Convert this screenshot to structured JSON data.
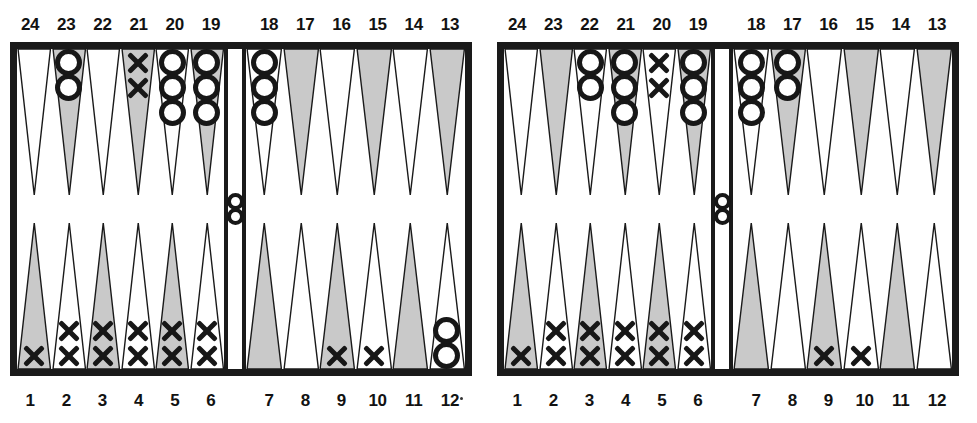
{
  "figure": {
    "kind": "backgammon-position-pair",
    "colors": {
      "ink": "#1a1a1a",
      "point_shaded": "#c9c9c9",
      "point_light": "#ffffff",
      "background": "#ffffff"
    },
    "checker_glyphs": {
      "o": "O",
      "x": "X"
    }
  },
  "boards": [
    {
      "id": "left",
      "top_labels": [
        "24",
        "23",
        "22",
        "21",
        "20",
        "19",
        "18",
        "17",
        "16",
        "15",
        "14",
        "13"
      ],
      "bottom_labels": [
        "1",
        "2",
        "3",
        "4",
        "5",
        "6",
        "7",
        "8",
        "9",
        "10",
        "11",
        "12"
      ],
      "bar": {
        "count": 2,
        "type": "o"
      },
      "points": {
        "24": {
          "count": 0,
          "type": null,
          "shade": "light"
        },
        "23": {
          "count": 2,
          "type": "o",
          "shade": "shaded"
        },
        "22": {
          "count": 0,
          "type": null,
          "shade": "light"
        },
        "21": {
          "count": 2,
          "type": "x",
          "shade": "shaded"
        },
        "20": {
          "count": 3,
          "type": "o",
          "shade": "light"
        },
        "19": {
          "count": 3,
          "type": "o",
          "shade": "shaded"
        },
        "18": {
          "count": 3,
          "type": "o",
          "shade": "light"
        },
        "17": {
          "count": 0,
          "type": null,
          "shade": "shaded"
        },
        "16": {
          "count": 0,
          "type": null,
          "shade": "light"
        },
        "15": {
          "count": 0,
          "type": null,
          "shade": "shaded"
        },
        "14": {
          "count": 0,
          "type": null,
          "shade": "light"
        },
        "13": {
          "count": 0,
          "type": null,
          "shade": "shaded"
        },
        "1": {
          "count": 1,
          "type": "x",
          "shade": "shaded"
        },
        "2": {
          "count": 2,
          "type": "x",
          "shade": "light"
        },
        "3": {
          "count": 2,
          "type": "x",
          "shade": "shaded"
        },
        "4": {
          "count": 2,
          "type": "x",
          "shade": "light"
        },
        "5": {
          "count": 2,
          "type": "x",
          "shade": "shaded"
        },
        "6": {
          "count": 2,
          "type": "x",
          "shade": "light"
        },
        "7": {
          "count": 0,
          "type": null,
          "shade": "shaded"
        },
        "8": {
          "count": 0,
          "type": null,
          "shade": "light"
        },
        "9": {
          "count": 1,
          "type": "x",
          "shade": "shaded"
        },
        "10": {
          "count": 1,
          "type": "x",
          "shade": "light"
        },
        "11": {
          "count": 0,
          "type": null,
          "shade": "shaded"
        },
        "12": {
          "count": 2,
          "type": "o",
          "shade": "light"
        }
      }
    },
    {
      "id": "right",
      "top_labels": [
        "24",
        "23",
        "22",
        "21",
        "20",
        "19",
        "18",
        "17",
        "16",
        "15",
        "14",
        "13"
      ],
      "bottom_labels": [
        "1",
        "2",
        "3",
        "4",
        "5",
        "6",
        "7",
        "8",
        "9",
        "10",
        "11",
        "12"
      ],
      "bar": {
        "count": 2,
        "type": "o"
      },
      "points": {
        "24": {
          "count": 0,
          "type": null,
          "shade": "light"
        },
        "23": {
          "count": 0,
          "type": null,
          "shade": "shaded"
        },
        "22": {
          "count": 2,
          "type": "o",
          "shade": "light"
        },
        "21": {
          "count": 3,
          "type": "o",
          "shade": "shaded"
        },
        "20": {
          "count": 2,
          "type": "x",
          "shade": "light"
        },
        "19": {
          "count": 3,
          "type": "o",
          "shade": "shaded"
        },
        "18": {
          "count": 3,
          "type": "o",
          "shade": "light"
        },
        "17": {
          "count": 2,
          "type": "o",
          "shade": "shaded"
        },
        "16": {
          "count": 0,
          "type": null,
          "shade": "light"
        },
        "15": {
          "count": 0,
          "type": null,
          "shade": "shaded"
        },
        "14": {
          "count": 0,
          "type": null,
          "shade": "light"
        },
        "13": {
          "count": 0,
          "type": null,
          "shade": "shaded"
        },
        "1": {
          "count": 1,
          "type": "x",
          "shade": "shaded"
        },
        "2": {
          "count": 2,
          "type": "x",
          "shade": "light"
        },
        "3": {
          "count": 2,
          "type": "x",
          "shade": "shaded"
        },
        "4": {
          "count": 2,
          "type": "x",
          "shade": "light"
        },
        "5": {
          "count": 2,
          "type": "x",
          "shade": "shaded"
        },
        "6": {
          "count": 2,
          "type": "x",
          "shade": "light"
        },
        "7": {
          "count": 0,
          "type": null,
          "shade": "shaded"
        },
        "8": {
          "count": 0,
          "type": null,
          "shade": "light"
        },
        "9": {
          "count": 1,
          "type": "x",
          "shade": "shaded"
        },
        "10": {
          "count": 1,
          "type": "x",
          "shade": "light"
        },
        "11": {
          "count": 0,
          "type": null,
          "shade": "shaded"
        },
        "12": {
          "count": 0,
          "type": null,
          "shade": "light"
        }
      }
    }
  ]
}
